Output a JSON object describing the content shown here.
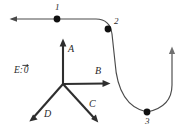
{
  "figure": {
    "background_color": "#ffffff",
    "stroke_color": "#3a3a3a",
    "marker_color": "#101010",
    "vector_color": "#2e2e2e",
    "width": 191,
    "height": 129
  },
  "trajectory": {
    "name": "path-with-arrows",
    "direction_note": "enters from left, turns down at point 2, U-turn through point 3, exits upward at right",
    "points": [
      {
        "id": "1",
        "label": "1",
        "x": 57,
        "y": 19,
        "label_x": 55,
        "label_y": 4
      },
      {
        "id": "2",
        "label": "2",
        "x": 108,
        "y": 29,
        "label_x": 114,
        "label_y": 18
      },
      {
        "id": "3",
        "label": "3",
        "x": 147,
        "y": 112,
        "label_x": 145,
        "label_y": 118
      }
    ],
    "arrowheads": [
      {
        "name": "entry-arrow",
        "x": 10,
        "y": 19,
        "direction": "left"
      },
      {
        "name": "exit-arrow",
        "x": 172,
        "y": 47,
        "direction": "up"
      }
    ]
  },
  "direction_key": {
    "origin": {
      "x": 63,
      "y": 84
    },
    "vectors": [
      {
        "id": "A",
        "label": "A",
        "tip_x": 63,
        "tip_y": 39,
        "label_x": 68,
        "label_y": 45
      },
      {
        "id": "B",
        "label": "B",
        "tip_x": 110,
        "tip_y": 83,
        "label_x": 95,
        "label_y": 67
      },
      {
        "id": "C",
        "label": "C",
        "tip_x": 98,
        "tip_y": 123,
        "label_x": 89,
        "label_y": 100
      },
      {
        "id": "D",
        "label": "D",
        "tip_x": 29,
        "tip_y": 121,
        "label_x": 44,
        "label_y": 110
      }
    ],
    "zero_entry": {
      "label": "E:",
      "value": "0",
      "x": 14,
      "y": 66
    }
  }
}
